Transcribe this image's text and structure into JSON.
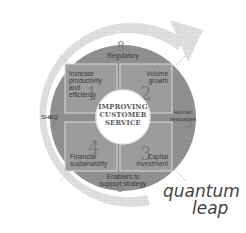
{
  "diagram": {
    "center": {
      "lines": [
        "IMPROVING",
        "CUSTOMER",
        "SERVICE"
      ]
    },
    "quadrants": [
      {
        "number": "1",
        "label_lines": [
          "Increase",
          "productivity",
          "and",
          "efficiency"
        ]
      },
      {
        "number": "2",
        "label_lines": [
          "Volume",
          "growth"
        ]
      },
      {
        "number": "3",
        "label_lines": [
          "Capital",
          "investment"
        ]
      },
      {
        "number": "4",
        "label_lines": [
          "Financial",
          "sustainability"
        ]
      }
    ],
    "ring_segments": [
      {
        "number": "8",
        "label_lines": [
          "Regulatory"
        ]
      },
      {
        "number": "5",
        "label_lines": [
          "Human",
          "resources"
        ]
      },
      {
        "number": "6",
        "label_lines": [
          "Enablers to",
          "support strategy"
        ]
      },
      {
        "number": "7",
        "label_lines": [
          "SHEQ"
        ]
      }
    ],
    "tagline": [
      "quantum",
      "leap"
    ],
    "colors": {
      "ring": "#8c8c8c",
      "quadrant": "#9a9a9a",
      "quadrant_border": "#d8d8d8",
      "center": "#ffffff",
      "arrow": "#d6d6d6",
      "text": "#3a3a3a"
    }
  }
}
